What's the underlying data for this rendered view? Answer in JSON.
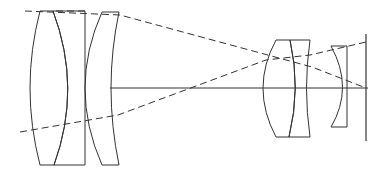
{
  "diagram": {
    "type": "optical-lens-layout",
    "stroke_color": "#333333",
    "background": "#ffffff",
    "elements": [
      {
        "id": "front-doublet-biconvex",
        "label": ""
      },
      {
        "id": "front-doublet-cemented-element",
        "label": ""
      },
      {
        "id": "front-meniscus",
        "label": ""
      },
      {
        "id": "rear-doublet-positive",
        "label": ""
      },
      {
        "id": "rear-doublet-negative",
        "label": ""
      },
      {
        "id": "field-flattener",
        "label": ""
      }
    ],
    "rays": 3,
    "labels": []
  }
}
